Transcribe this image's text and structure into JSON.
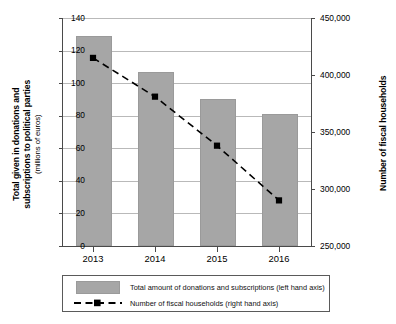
{
  "chart_data": {
    "type": "bar",
    "title": "",
    "categories": [
      "2013",
      "2014",
      "2015",
      "2016"
    ],
    "xlabel": "",
    "ylabel": "Total given in donations and subscriptions to political parties (millions of euros)",
    "y2label": "Number of fiscal households",
    "ylim": [
      0,
      140
    ],
    "y2lim": [
      250000,
      450000
    ],
    "ytick_labels": [
      "140",
      "120",
      "100",
      "80",
      "60",
      "40",
      "20",
      "0"
    ],
    "ytick_values": [
      140,
      120,
      100,
      80,
      60,
      40,
      20,
      0
    ],
    "y2tick_labels": [
      "450,000",
      "400,000",
      "350,000",
      "300,000",
      "250,000"
    ],
    "y2tick_values": [
      450000,
      400000,
      350000,
      300000,
      250000
    ],
    "grid": true,
    "legend_position": "below",
    "series": [
      {
        "name": "Total amount of  donations and subscriptions (left hand axis)",
        "type": "bar",
        "axis": "left",
        "color": "#a6a6a6",
        "values": [
          129,
          107,
          90,
          81
        ]
      },
      {
        "name": "Number of fiscal households (right hand axis)",
        "type": "line",
        "axis": "right",
        "color": "#000000",
        "linestyle": "dashed",
        "marker": "square",
        "values": [
          415000,
          381000,
          338000,
          290000
        ]
      }
    ]
  },
  "axis_titles": {
    "left_main": "Total given in donations and",
    "left_main2": "subscriptions to political parties",
    "left_sub": "(millions of euros)",
    "right": "Number of fiscal households"
  },
  "legend": {
    "bar_label": "Total amount of  donations and subscriptions (left hand axis)",
    "line_label": "Number of fiscal households (right hand axis)"
  }
}
